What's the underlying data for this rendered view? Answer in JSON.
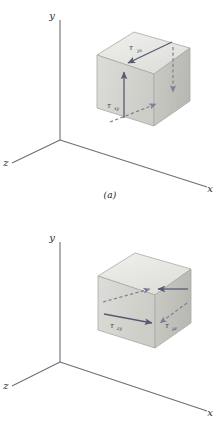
{
  "figure": {
    "background_color": "#ffffff",
    "axis_color": "#6e6e78",
    "arrow_color": "#565a72",
    "cube_top_color": "#e8e8e6",
    "cube_left_color": "#d6d6d2",
    "cube_right_color": "#c2c2bd",
    "cube_edge_color": "#a8a8a4",
    "label_color": "#3a3a52"
  },
  "panels": [
    {
      "id": "a",
      "caption": "(a)",
      "axes": {
        "y_label": "y",
        "x_label": "x",
        "z_label": "z"
      },
      "stress_labels": [
        {
          "symbol": "τ",
          "subscript": "yx",
          "full": "τyx",
          "position": "cube-top-face"
        },
        {
          "symbol": "τ",
          "subscript": "xy",
          "full": "τxy",
          "position": "cube-front-left-face"
        }
      ],
      "arrows": [
        {
          "name": "tau-xy-up-solid",
          "style": "solid",
          "direction": "up",
          "face": "front-left"
        },
        {
          "name": "tau-yx-top-solid",
          "style": "solid",
          "direction": "down-left",
          "face": "top"
        },
        {
          "name": "tau-xy-down-dashed",
          "style": "dashed",
          "direction": "down",
          "face": "right"
        },
        {
          "name": "tau-yx-bottom-dashed",
          "style": "dashed",
          "direction": "right",
          "face": "bottom"
        }
      ]
    },
    {
      "id": "b",
      "caption": "(b)",
      "axes": {
        "y_label": "y",
        "x_label": "x",
        "z_label": "z"
      },
      "stress_labels": [
        {
          "symbol": "τ",
          "subscript": "zy",
          "full": "τzy",
          "position": "cube-front-left-face"
        },
        {
          "symbol": "τ",
          "subscript": "yz",
          "full": "τyz",
          "position": "cube-right-face"
        }
      ],
      "arrows": [
        {
          "name": "tau-zy-right-solid",
          "style": "solid",
          "direction": "right",
          "face": "front-left"
        },
        {
          "name": "tau-zy-up-dashed",
          "style": "dashed",
          "direction": "up-right",
          "face": "front-left-upper"
        },
        {
          "name": "tau-yz-left-solid",
          "style": "solid",
          "direction": "left",
          "face": "right"
        },
        {
          "name": "tau-yz-down-dashed",
          "style": "dashed",
          "direction": "down-right",
          "face": "right-upper"
        }
      ]
    }
  ]
}
